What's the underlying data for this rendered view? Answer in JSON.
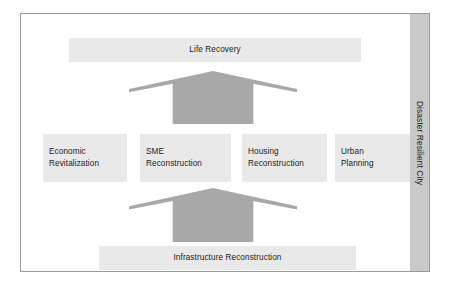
{
  "diagram": {
    "frame": {
      "border_color": "#9a9a9a"
    },
    "palette": {
      "block_fill": "#e9e9e9",
      "arrow_fill": "#a8a8a8",
      "band_fill": "#c9c9c9",
      "text_color": "#1a1a1a",
      "background": "#ffffff"
    },
    "top_banner": {
      "label": "Life Recovery"
    },
    "pillars": [
      {
        "line1": "Economic",
        "line2": "Revitalization"
      },
      {
        "line1": "SME",
        "line2": "Reconstruction"
      },
      {
        "line1": "Housing",
        "line2": "Reconstruction"
      },
      {
        "line1": "Urban",
        "line2": "Planning"
      }
    ],
    "bottom_banner": {
      "label": "Infrastructure Reconstruction"
    },
    "side_band": {
      "label": "Disaster Resilient City"
    },
    "arrows": [
      {
        "name": "upward-arrow-to-life-recovery",
        "direction": "up"
      },
      {
        "name": "upward-arrow-from-infrastructure",
        "direction": "up"
      }
    ]
  }
}
